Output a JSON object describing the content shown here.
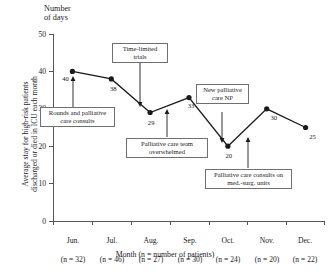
{
  "chart_data": {
    "type": "line",
    "title": "",
    "ylabel_top": "Number\nof days",
    "ylabel": "Average stay for high-risk patients\ndischarged or died in ICU each month",
    "xlabel": "Month (n = number of patients)",
    "categories": [
      "Jun.",
      "Jul.",
      "Aug.",
      "Sep.",
      "Oct.",
      "Nov.",
      "Dec."
    ],
    "category_sublabels": [
      "(n = 32)",
      "(n = 46)",
      "(n = 27)",
      "(n = 30)",
      "(n = 24)",
      "(n = 20)",
      "(n = 22)"
    ],
    "values": [
      40,
      38,
      29,
      33,
      20,
      30,
      25
    ],
    "point_labels": [
      "40",
      "38",
      "29",
      "33",
      "20",
      "30",
      "25"
    ],
    "ylim": [
      0,
      50
    ],
    "yticks": [
      "0",
      "10",
      "20",
      "30",
      "40",
      "50"
    ],
    "grid": false,
    "legend": "none",
    "marker": "filled-circle",
    "line_color": "#1a1a1a",
    "annotations": [
      {
        "text": "Rounds and palliative\ncare consults",
        "target_category": "Jun.",
        "target_value": 40
      },
      {
        "text": "Time-limited\ntrials",
        "target_category": "Aug.",
        "target_value": 29
      },
      {
        "text": "Palliative care team\noverwhelmed",
        "target_category": "Sep.",
        "target_value": 33
      },
      {
        "text": "New palliative\ncare NP",
        "target_category": "Oct.",
        "target_value": 20
      },
      {
        "text": "Palliative care consults on\nmed.-surg. units",
        "target_category": "Nov.",
        "target_value": 30
      }
    ]
  }
}
